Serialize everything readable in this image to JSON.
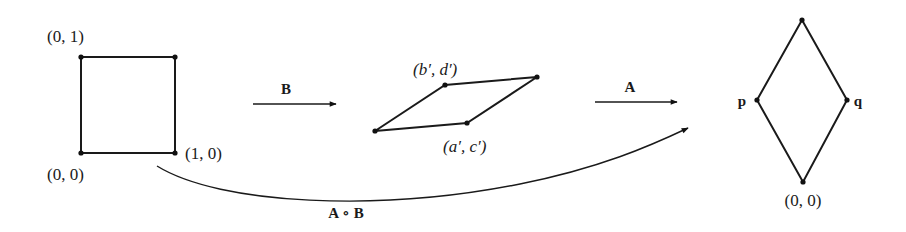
{
  "diagram": {
    "square": {
      "labels": {
        "top_left": "(0, 1)",
        "bottom_left": "(0, 0)",
        "bottom_right": "(1, 0)"
      }
    },
    "arrow_b": {
      "label": "B"
    },
    "parallelogram": {
      "labels": {
        "upper": "(b′, d′)",
        "lower": "(a′, c′)"
      }
    },
    "arrow_a": {
      "label": "A"
    },
    "diamond": {
      "labels": {
        "left": "p",
        "right": "q",
        "bottom": "(0, 0)"
      }
    },
    "composition_arrow": {
      "label": "A ∘ B"
    }
  }
}
